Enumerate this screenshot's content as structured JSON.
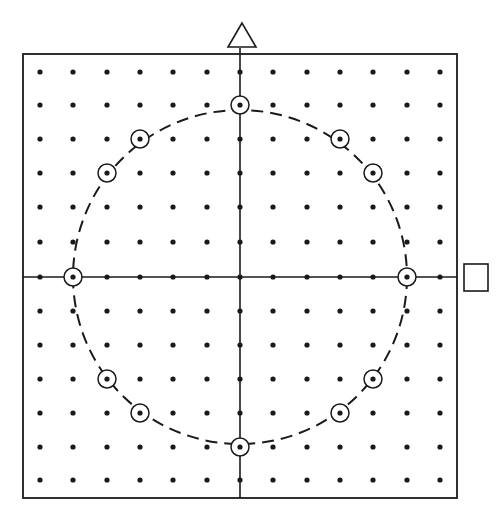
{
  "diagram": {
    "colors": {
      "ink": "#1a1a1a",
      "background": "#ffffff"
    },
    "frame": {
      "x": 23,
      "y": 54,
      "width": 434,
      "height": 444
    },
    "lattice": {
      "columns": [
        40,
        73,
        107,
        140,
        173,
        207,
        240,
        273,
        307,
        340,
        373,
        407,
        440
      ],
      "rows": [
        72,
        105,
        139,
        173,
        207,
        242,
        277,
        311,
        345,
        379,
        413,
        447,
        480
      ],
      "dot_radius": 2.6
    },
    "axes": {
      "origin": {
        "x": 240,
        "y": 277
      },
      "vertical_marker": {
        "shape": "triangle",
        "name": "triangle-marker"
      },
      "horizontal_marker": {
        "shape": "square",
        "name": "square-marker"
      }
    },
    "circle": {
      "cx": 240,
      "cy": 277,
      "r": 167,
      "style": "dashed",
      "radius_units": 5
    },
    "circled_points": [
      {
        "x": 240,
        "y": 105,
        "lattice": [
          0,
          5
        ]
      },
      {
        "x": 340,
        "y": 139,
        "lattice": [
          3,
          4
        ]
      },
      {
        "x": 373,
        "y": 173,
        "lattice": [
          4,
          3
        ]
      },
      {
        "x": 407,
        "y": 277,
        "lattice": [
          5,
          0
        ]
      },
      {
        "x": 373,
        "y": 379,
        "lattice": [
          4,
          -3
        ]
      },
      {
        "x": 340,
        "y": 413,
        "lattice": [
          3,
          -4
        ]
      },
      {
        "x": 240,
        "y": 447,
        "lattice": [
          0,
          -5
        ]
      },
      {
        "x": 140,
        "y": 413,
        "lattice": [
          -3,
          -4
        ]
      },
      {
        "x": 107,
        "y": 379,
        "lattice": [
          -4,
          -3
        ]
      },
      {
        "x": 73,
        "y": 277,
        "lattice": [
          -5,
          0
        ]
      },
      {
        "x": 107,
        "y": 173,
        "lattice": [
          -4,
          3
        ]
      },
      {
        "x": 140,
        "y": 139,
        "lattice": [
          -3,
          4
        ]
      }
    ],
    "circled_point_ring_radius": 9
  }
}
